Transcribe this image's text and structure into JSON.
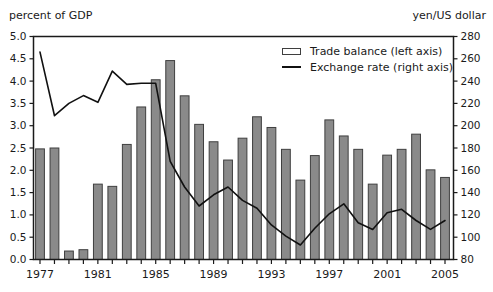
{
  "chart_data": {
    "type": "bar+line",
    "ylabel_left": "percent of GDP",
    "ylabel_right": "yen/US dollar",
    "categories": [
      "1977",
      "1978",
      "1979",
      "1980",
      "1981",
      "1982",
      "1983",
      "1984",
      "1985",
      "1986",
      "1987",
      "1988",
      "1989",
      "1990",
      "1991",
      "1992",
      "1993",
      "1994",
      "1995",
      "1996",
      "1997",
      "1998",
      "1999",
      "2000",
      "2001",
      "2002",
      "2003",
      "2004",
      "2005"
    ],
    "series": [
      {
        "name": "Trade balance (left axis)",
        "type": "bar",
        "axis": "left",
        "values": [
          2.48,
          2.5,
          0.19,
          0.22,
          1.69,
          1.64,
          2.58,
          3.42,
          4.03,
          4.46,
          3.67,
          3.03,
          2.64,
          2.23,
          2.72,
          3.2,
          2.96,
          2.47,
          1.78,
          2.33,
          3.13,
          2.77,
          2.47,
          1.69,
          2.34,
          2.47,
          2.81,
          2.01,
          1.84
        ]
      },
      {
        "name": "Exchange rate (right axis)",
        "type": "line",
        "axis": "right",
        "values": [
          266,
          209,
          220,
          227,
          221,
          249,
          237,
          238,
          238,
          168,
          145,
          128,
          138,
          145,
          133,
          126,
          111,
          101,
          93,
          108,
          121,
          130,
          113,
          107,
          122,
          125,
          115,
          107,
          115
        ]
      }
    ],
    "left_axis": {
      "min": 0,
      "max": 5,
      "step": 0.5,
      "label_decimals": 1
    },
    "right_axis": {
      "min": 80,
      "max": 280,
      "step": 20,
      "label_decimals": 0
    },
    "x_axis": {
      "first_labeled_year": 1977,
      "label_interval": 4,
      "minor_ticks": "yearly"
    },
    "legend": [
      "Trade balance (left axis)",
      "Exchange rate (right axis)"
    ],
    "grid": "off",
    "legend_position": "inside-top-right",
    "colors": {
      "bar_fill": "#8a8a8a",
      "bar_stroke": "#3f3f3f",
      "line": "#111111",
      "axis": "#1a1a1a",
      "text": "#1a1a1a",
      "background": "#ffffff"
    }
  }
}
